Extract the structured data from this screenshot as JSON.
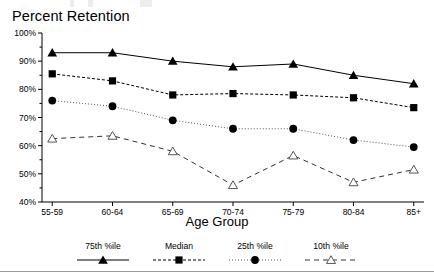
{
  "chart_data": {
    "type": "line",
    "title": "Percent Retention",
    "xlabel": "Age Group",
    "ylabel": "",
    "categories": [
      "55-59",
      "60-64",
      "65-69",
      "70-74",
      "75-79",
      "80-84",
      "85+"
    ],
    "ylim": [
      40,
      100
    ],
    "ytick_labels": [
      "100%",
      "90%",
      "80%",
      "70%",
      "60%",
      "50%",
      "40%"
    ],
    "ytick_values": [
      100,
      90,
      80,
      70,
      60,
      50,
      40
    ],
    "grid": false,
    "legend_position": "bottom",
    "series": [
      {
        "name": "75th %ile",
        "marker": "filled-triangle",
        "line_style": "solid",
        "values": [
          93,
          93,
          90,
          88,
          89,
          85,
          82
        ]
      },
      {
        "name": "Median",
        "marker": "filled-square",
        "line_style": "dashed",
        "values": [
          85.5,
          83,
          78,
          78.5,
          78,
          77,
          73.5
        ]
      },
      {
        "name": "25th %ile",
        "marker": "filled-circle",
        "line_style": "dotted",
        "values": [
          76,
          74,
          69,
          66,
          66,
          62,
          59.5
        ]
      },
      {
        "name": "10th %ile",
        "marker": "open-triangle",
        "line_style": "long-dashed",
        "values": [
          62.5,
          63.5,
          58,
          46,
          56.5,
          47,
          51.5
        ]
      }
    ]
  },
  "legend": {
    "items": [
      {
        "label": "75th %ile"
      },
      {
        "label": "Median"
      },
      {
        "label": "25th %ile"
      },
      {
        "label": "10th %ile"
      }
    ]
  }
}
